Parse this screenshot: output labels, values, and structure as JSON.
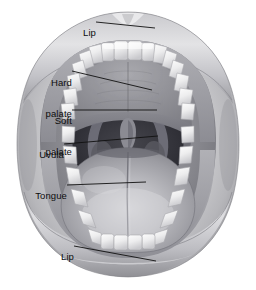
{
  "figure": {
    "background_color": "#ffffff",
    "label_color": "#0d0d0d",
    "leader_line_color": "#111111"
  },
  "labels": [
    {
      "id": "lip-upper",
      "text": "Lip",
      "align": "right",
      "text_x": 92,
      "text_y": 17,
      "leader": "M 96 22 L 155 28",
      "target": "upper lip"
    },
    {
      "id": "hard-palate",
      "text": "Hard\npalate",
      "line1": "Hard",
      "line2": "palate",
      "align": "right",
      "text_x": 68,
      "text_y": 59,
      "leader": "M 72 71 L 152 90",
      "target": "hard palate"
    },
    {
      "id": "soft-palate",
      "text": "Soft\npalate",
      "line1": "Soft",
      "line2": "palate",
      "align": "right",
      "text_x": 68,
      "text_y": 97,
      "leader": "M 72 110 L 157 110",
      "target": "soft palate"
    },
    {
      "id": "uvula",
      "text": "Uvula",
      "align": "right",
      "text_x": 60,
      "text_y": 139,
      "leader": "M 64 144 L 158 136",
      "target": "uvula"
    },
    {
      "id": "tongue",
      "text": "Tongue",
      "align": "right",
      "text_x": 63,
      "text_y": 180,
      "leader": "M 67 185 L 146 182",
      "target": "tongue"
    },
    {
      "id": "lip-lower",
      "text": "Lip",
      "align": "right",
      "text_x": 70,
      "text_y": 241,
      "leader": "M 74 246 L 156 261",
      "target": "lower lip"
    }
  ],
  "anatomy_parts": [
    {
      "name": "upper-lip",
      "label": "Lip"
    },
    {
      "name": "upper-teeth",
      "label": "Upper teeth",
      "count": 14
    },
    {
      "name": "hard-palate",
      "label": "Hard palate"
    },
    {
      "name": "soft-palate",
      "label": "Soft palate"
    },
    {
      "name": "uvula",
      "label": "Uvula"
    },
    {
      "name": "oropharynx",
      "label": "Throat"
    },
    {
      "name": "tongue",
      "label": "Tongue"
    },
    {
      "name": "lower-teeth",
      "label": "Lower teeth",
      "count": 14
    },
    {
      "name": "lower-lip",
      "label": "Lip"
    }
  ]
}
